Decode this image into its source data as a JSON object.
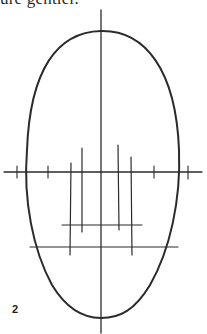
{
  "caption": {
    "text": "ure gentler."
  },
  "figure": {
    "number": "2",
    "stroke_color": "#2b2b2b",
    "background": "#ffffff"
  }
}
